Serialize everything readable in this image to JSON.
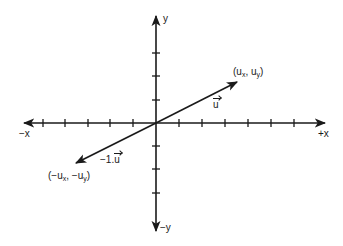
{
  "diagram": {
    "type": "vector-coordinate-plane",
    "colors": {
      "stroke": "#1a1a1a",
      "background": "#ffffff"
    },
    "axes": {
      "x_positive_label": "+x",
      "x_negative_label": "−x",
      "y_positive_label": "y",
      "y_negative_label": "−y",
      "x_ticks_negative": 5,
      "x_ticks_positive": 6,
      "y_ticks_positive": 3,
      "y_ticks_negative": 3
    },
    "vectors": [
      {
        "name": "u",
        "label": "u",
        "endpoint_label": {
          "open": "(u",
          "sub1": "x",
          "mid": ", u",
          "sub2": "y",
          "close": ")"
        },
        "direction": "up-right"
      },
      {
        "name": "negative-u",
        "label_prefix": "−1.",
        "label": "u",
        "endpoint_label": {
          "open": "(−u",
          "sub1": "x",
          "mid": ", −u",
          "sub2": "y",
          "close": ")"
        },
        "direction": "down-left"
      }
    ]
  }
}
